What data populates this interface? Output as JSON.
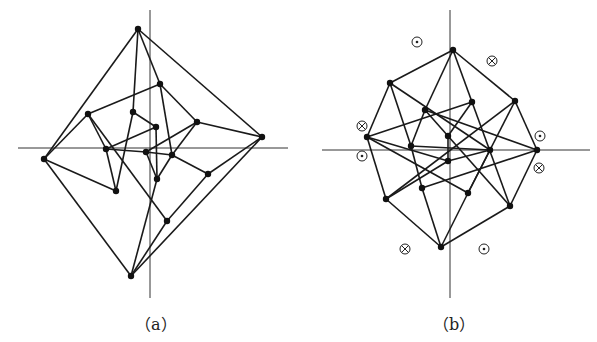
{
  "figures": [
    {
      "id": "a",
      "caption": "（a）",
      "axes": {
        "h": [
          18,
          148,
          288,
          148
        ],
        "v": [
          150,
          10,
          150,
          298
        ]
      },
      "nodes": [
        [
          138,
          29
        ],
        [
          262,
          137
        ],
        [
          44,
          159
        ],
        [
          131,
          276
        ],
        [
          160,
          84
        ],
        [
          88,
          114
        ],
        [
          133,
          112
        ],
        [
          156,
          127
        ],
        [
          197,
          122
        ],
        [
          106,
          149
        ],
        [
          146,
          152
        ],
        [
          172,
          155
        ],
        [
          208,
          174
        ],
        [
          157,
          179
        ],
        [
          116,
          191
        ],
        [
          167,
          221
        ]
      ],
      "edges": [
        [
          0,
          2
        ],
        [
          0,
          1
        ],
        [
          0,
          6
        ],
        [
          0,
          4
        ],
        [
          2,
          5
        ],
        [
          2,
          3
        ],
        [
          2,
          14
        ],
        [
          1,
          12
        ],
        [
          1,
          3
        ],
        [
          1,
          8
        ],
        [
          3,
          15
        ],
        [
          3,
          13
        ],
        [
          4,
          5
        ],
        [
          4,
          11
        ],
        [
          4,
          8
        ],
        [
          5,
          9
        ],
        [
          5,
          15
        ],
        [
          6,
          14
        ],
        [
          6,
          7
        ],
        [
          7,
          9
        ],
        [
          7,
          13
        ],
        [
          8,
          11
        ],
        [
          8,
          10
        ],
        [
          9,
          14
        ],
        [
          9,
          10
        ],
        [
          10,
          11
        ],
        [
          10,
          13
        ],
        [
          11,
          12
        ],
        [
          12,
          15
        ],
        [
          11,
          13
        ]
      ]
    },
    {
      "id": "b",
      "caption": "（b）",
      "axes": {
        "h": [
          322,
          150,
          590,
          150
        ],
        "v": [
          450,
          10,
          450,
          298
        ]
      },
      "nodes": [
        [
          453,
          50
        ],
        [
          390,
          83
        ],
        [
          515,
          101
        ],
        [
          537,
          150
        ],
        [
          510,
          206
        ],
        [
          441,
          247
        ],
        [
          386,
          199
        ],
        [
          367,
          137
        ],
        [
          425,
          110
        ],
        [
          472,
          102
        ],
        [
          411,
          146
        ],
        [
          448,
          136
        ],
        [
          448,
          161
        ],
        [
          490,
          150
        ],
        [
          422,
          188
        ],
        [
          468,
          193
        ]
      ],
      "edges": [
        [
          0,
          1
        ],
        [
          0,
          2
        ],
        [
          0,
          8
        ],
        [
          0,
          9
        ],
        [
          2,
          3
        ],
        [
          3,
          4
        ],
        [
          4,
          5
        ],
        [
          5,
          6
        ],
        [
          6,
          7
        ],
        [
          7,
          1
        ],
        [
          1,
          10
        ],
        [
          1,
          13
        ],
        [
          2,
          15
        ],
        [
          2,
          6
        ],
        [
          3,
          8
        ],
        [
          3,
          14
        ],
        [
          4,
          9
        ],
        [
          4,
          11
        ],
        [
          5,
          14
        ],
        [
          5,
          15
        ],
        [
          6,
          12
        ],
        [
          7,
          9
        ],
        [
          7,
          15
        ],
        [
          7,
          12
        ],
        [
          8,
          10
        ],
        [
          8,
          11
        ],
        [
          9,
          11
        ],
        [
          10,
          14
        ],
        [
          11,
          12
        ],
        [
          12,
          13
        ],
        [
          13,
          15
        ],
        [
          10,
          13
        ]
      ],
      "markers": [
        {
          "type": "dot",
          "x": 417,
          "y": 42
        },
        {
          "type": "cross",
          "x": 492,
          "y": 61
        },
        {
          "type": "cross",
          "x": 362,
          "y": 126
        },
        {
          "type": "dot",
          "x": 540,
          "y": 136
        },
        {
          "type": "dot",
          "x": 362,
          "y": 156
        },
        {
          "type": "cross",
          "x": 539,
          "y": 168
        },
        {
          "type": "cross",
          "x": 405,
          "y": 249
        },
        {
          "type": "dot",
          "x": 484,
          "y": 249
        }
      ]
    }
  ],
  "captions": {
    "a": "（a）",
    "b": "（b）"
  }
}
